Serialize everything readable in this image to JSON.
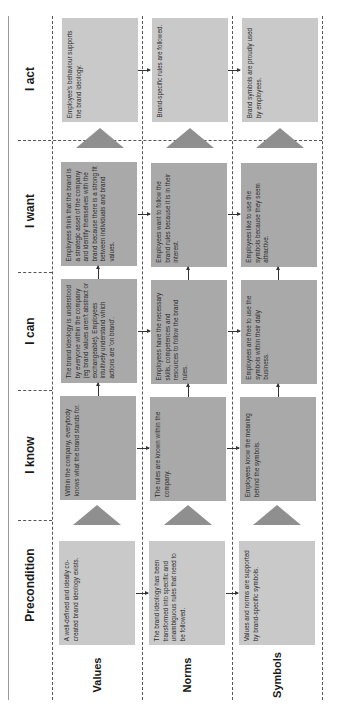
{
  "diagram": {
    "orientation": "rotated-90-ccw",
    "stages": [
      {
        "key": "precondition",
        "label": "Precondition"
      },
      {
        "key": "know",
        "label": "I know"
      },
      {
        "key": "can",
        "label": "I can"
      },
      {
        "key": "want",
        "label": "I want"
      },
      {
        "key": "act",
        "label": "I act"
      }
    ],
    "dimensions": [
      {
        "key": "values",
        "label": "Values"
      },
      {
        "key": "norms",
        "label": "Norms"
      },
      {
        "key": "symbols",
        "label": "Symbols"
      }
    ],
    "cells": {
      "precondition": {
        "values": "A well-defined and ideally co-created brand ideology exists.",
        "norms": "The brand ideology has been transformed into specific and unambiguous rules that need to be followed.",
        "symbols": "Values and norms are supported by brand-specific symbols."
      },
      "know": {
        "values": "Within the company, everybody knows what the brand stands for.",
        "norms": "The rules are known within the company.",
        "symbols": "Employees know the meaning behind the symbols."
      },
      "can": {
        "values": "The brand ideology is understood by everyone within the company (eg brand values aren't abstract or exchangeable). Employees intuitively understand which actions are 'on brand'.",
        "norms": "Employees have the necessary skills, competences and resources to follow the brand rules.",
        "symbols": "Employees are free to use the symbols within their daily business."
      },
      "want": {
        "values": "Employees think that the brand is a strategic asset of the company and identify themselves with the brand because there is a strong fit between individuals and brand values.",
        "norms": "Employees want to follow the brand rules because it is in their interest.",
        "symbols": "Employees like to use the symbols because they seem attractive."
      },
      "act": {
        "values": "Employee's behaviour supports the brand ideology.",
        "norms": "Brand-specific rules are followed.",
        "symbols": "Brand symbols are proudly used by employees."
      }
    },
    "colors": {
      "dark_box": "#a9a9a9",
      "light_box": "#c9c9c9",
      "triangle": "#8f8f8f",
      "lines": "#555555"
    }
  }
}
